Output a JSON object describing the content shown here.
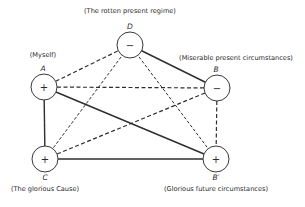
{
  "diagram": {
    "type": "signed-balance-graph",
    "nodes": [
      {
        "id": "A",
        "letter": "A",
        "caption": "(Myself)",
        "sign": "+",
        "x": 44,
        "y": 87,
        "letter_pos": "above",
        "caption_pos": "above"
      },
      {
        "id": "B",
        "letter": "B",
        "caption": "(Miserable present circumstances)",
        "sign": "−",
        "x": 217,
        "y": 88,
        "letter_pos": "above",
        "caption_pos": "above"
      },
      {
        "id": "C",
        "letter": "C",
        "caption": "(The glorious Cause)",
        "sign": "+",
        "x": 45,
        "y": 159,
        "letter_pos": "below",
        "caption_pos": "below"
      },
      {
        "id": "B2",
        "letter": "B′",
        "caption": "(Glorious future circumstances)",
        "sign": "+",
        "x": 216,
        "y": 159,
        "letter_pos": "below",
        "caption_pos": "below"
      },
      {
        "id": "D",
        "letter": "D",
        "caption": "(The rotten present regime)",
        "sign": "−",
        "x": 130,
        "y": 45,
        "letter_pos": "above",
        "caption_pos": "above"
      }
    ],
    "edges": [
      {
        "from": "A",
        "to": "D",
        "style": "dashed"
      },
      {
        "from": "A",
        "to": "B",
        "style": "dashed"
      },
      {
        "from": "A",
        "to": "B2",
        "style": "solid"
      },
      {
        "from": "A",
        "to": "C",
        "style": "solid"
      },
      {
        "from": "D",
        "to": "B",
        "style": "solid"
      },
      {
        "from": "D",
        "to": "C",
        "style": "fine-dashed"
      },
      {
        "from": "D",
        "to": "B2",
        "style": "fine-dashed"
      },
      {
        "from": "B",
        "to": "C",
        "style": "dashed"
      },
      {
        "from": "B",
        "to": "B2",
        "style": "dashed"
      },
      {
        "from": "C",
        "to": "B2",
        "style": "solid"
      }
    ],
    "labels": {
      "A": {
        "letter": "A",
        "caption": "(Myself)",
        "sign": "+"
      },
      "B": {
        "letter": "B",
        "caption": "(Miserable present circumstances)",
        "sign": "−"
      },
      "C": {
        "letter": "C",
        "caption": "(The glorious Cause)",
        "sign": "+"
      },
      "B2": {
        "letter": "B′",
        "caption": "(Glorious future circumstances)",
        "sign": "+"
      },
      "D": {
        "letter": "D",
        "caption": "(The rotten present regime)",
        "sign": "−"
      }
    },
    "node_radius": 13
  }
}
